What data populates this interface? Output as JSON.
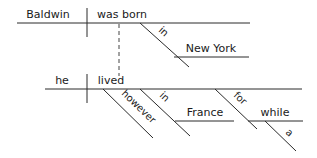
{
  "diagram": {
    "type": "reed-kellogg-sentence-diagram",
    "clause1": {
      "subject": "Baldwin",
      "verb": "was born",
      "modifiers": [
        {
          "preposition": "in",
          "object": "New York"
        }
      ]
    },
    "clause2": {
      "subject": "he",
      "verb": "lived",
      "modifiers": [
        {
          "adverb": "however"
        },
        {
          "preposition": "in",
          "object": "France"
        },
        {
          "preposition": "for",
          "object": "while",
          "object_modifier": "a"
        }
      ]
    },
    "connector": "dashed"
  }
}
